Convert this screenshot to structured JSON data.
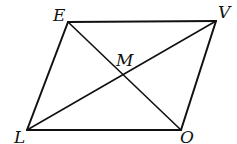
{
  "diagram": {
    "type": "parallelogram",
    "vertices": {
      "E": {
        "label": "E",
        "x": 68,
        "y": 22,
        "lx": 53,
        "ly": 21
      },
      "V": {
        "label": "V",
        "x": 216,
        "y": 21,
        "lx": 218,
        "ly": 18
      },
      "O": {
        "label": "O",
        "x": 181,
        "y": 130,
        "lx": 180,
        "ly": 143
      },
      "L": {
        "label": "L",
        "x": 27,
        "y": 130,
        "lx": 14,
        "ly": 143
      }
    },
    "intersection": {
      "label": "M",
      "x": 123,
      "y": 77,
      "lx": 116,
      "ly": 66
    },
    "edges": [
      [
        "E",
        "V"
      ],
      [
        "V",
        "O"
      ],
      [
        "O",
        "L"
      ],
      [
        "L",
        "E"
      ]
    ],
    "diagonals": [
      [
        "E",
        "O"
      ],
      [
        "L",
        "V"
      ]
    ],
    "stroke_color": "#111111"
  }
}
